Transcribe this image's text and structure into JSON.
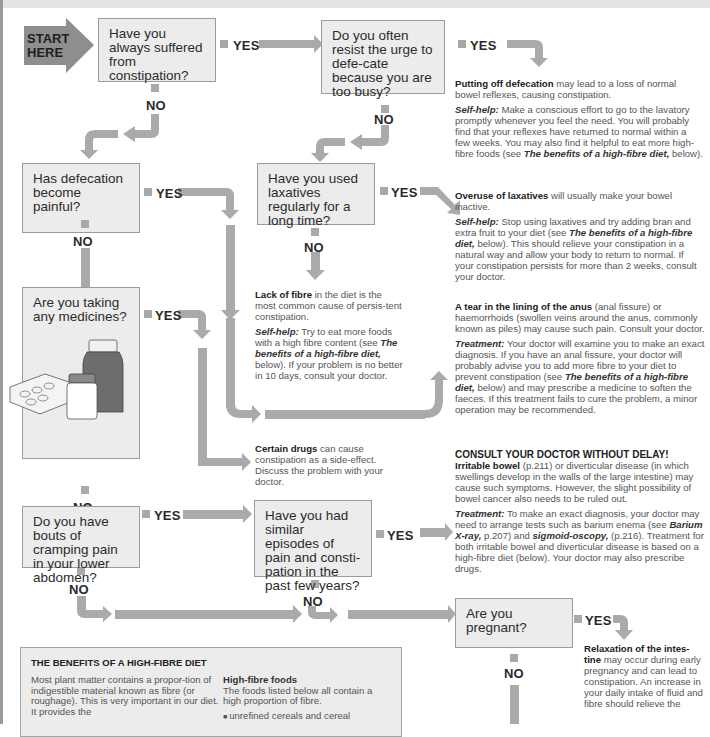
{
  "start": {
    "label_line1": "START",
    "label_line2": "HERE"
  },
  "colors": {
    "arrow": "#aaaaaa",
    "box_fill": "#ececec",
    "box_border": "#9c9c9c",
    "start_fill": "#8e8e8e",
    "text": "#2a2a2a"
  },
  "questions": {
    "q1": "Have you always suffered from constipation?",
    "q2": "Do you often resist the urge to defe-cate because you are too busy?",
    "q3": "Has defecation become painful?",
    "q4": "Have you used laxatives regularly for a long time?",
    "q5": "Are you taking any medicines?",
    "q6": "Do you have bouts of cramping pain in your lower abdomen?",
    "q7": "Have you had similar episodes of pain and consti-pation in the past few years?",
    "q8": "Are you pregnant?"
  },
  "labels": {
    "yes": "YES",
    "no": "NO"
  },
  "outcomes": {
    "putting_off": {
      "title": "Putting off defecation",
      "text": " may lead to a loss of normal bowel reflexes, causing constipation.",
      "selfhelp_label": "Self-help:",
      "selfhelp_text": " Make a conscious effort to go to the lavatory promptly whenever you feel the need. You will probably find that your reflexes have returned to normal within a few weeks. You may also find it helpful to eat more high-fibre foods (see ",
      "ref": "The benefits of a high-fibre diet,",
      "ref_after": " below)."
    },
    "overuse": {
      "title": "Overuse of laxatives",
      "text": " will usually make your bowel inactive.",
      "selfhelp_label": "Self-help:",
      "selfhelp_text": " Stop using laxatives and try adding bran and extra fruit to your diet (see ",
      "ref": "The benefits of a high-fibre diet,",
      "ref_after": " below). This should relieve your constipation in a natural way and allow your body to return to normal. If your constipation persists for more than 2 weeks, consult your doctor."
    },
    "lack_fibre": {
      "title": "Lack of fibre",
      "text": " in the diet is the most common cause of persis-tent constipation.",
      "selfhelp_label": "Self-help:",
      "selfhelp_text": " Try to eat more foods with a high fibre content (see ",
      "ref": "The benefits of a high-fibre diet,",
      "ref_after": " below). If your problem is no better in 10 days, consult your doctor."
    },
    "tear": {
      "title": "A tear in the lining of the anus",
      "text": " (anal fissure) or haemorrhoids (swollen veins around the anus, commonly known as piles) may cause such pain. Consult your doctor.",
      "treatment_label": "Treatment:",
      "treatment_text": " Your doctor will examine you to make an exact diagnosis. If you have an anal fissure, your doctor will probably advise you to add more fibre to your diet to prevent constipation (see ",
      "ref": "The benefits of a high-fibre diet,",
      "ref_after": " below) and may prescribe a medicine to soften the faeces. If this treatment fails to cure the problem, a minor operation may be recommended."
    },
    "drugs": {
      "title": "Certain drugs",
      "text": " can cause constipation as a side-effect. Discuss the problem with your doctor."
    },
    "consult": {
      "warning": "CONSULT YOUR DOCTOR WITHOUT DELAY!",
      "title": "Irritable bowel",
      "text": " (p.211) or diverticular disease (in which swellings develop in the walls of the large intestine) may cause such symptoms. However, the slight possibility of bowel cancer also needs to be ruled out.",
      "treatment_label": "Treatment:",
      "treatment_text": " To make an exact diagnosis, your doctor may need to arrange tests such as barium enema (see ",
      "ref1": "Barium X-ray,",
      "mid": " p.207) and ",
      "ref2": "sigmoid-oscopy,",
      "treatment_after": " (p.216). Treatment for both irritable bowel and diverticular disease is based on a high-fibre diet (below). Your doctor may also prescribe drugs."
    },
    "relaxation": {
      "title": "Relaxation of the intes-tine",
      "text": " may occur during early pregnancy and can lead to constipation. An increase in your daily intake of fluid and fibre should relieve the"
    }
  },
  "fibre_box": {
    "title": "THE BENEFITS OF A  HIGH-FIBRE DIET",
    "left_text": "Most plant matter contains a propor-tion of indigestible material known as fibre (or roughage). This is very important in our diet. It provides the",
    "right_heading": "High-fibre foods",
    "right_text": "The foods listed below all contain a high proportion of fibre.",
    "items": [
      "unrefined cereals and cereal"
    ]
  }
}
